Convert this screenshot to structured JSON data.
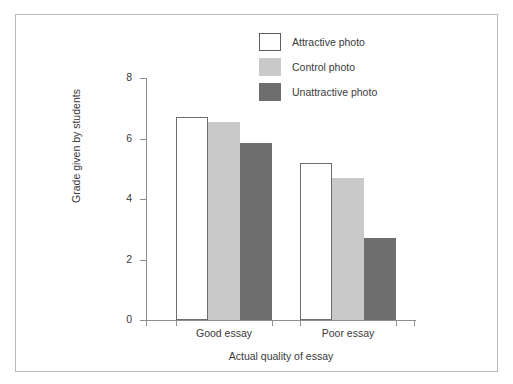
{
  "chart_data": {
    "type": "bar",
    "title": "",
    "xlabel": "Actual quality of essay",
    "ylabel": "Grade given by students",
    "categories": [
      "Good essay",
      "Poor essay"
    ],
    "series": [
      {
        "name": "Attractive photo",
        "values": [
          6.7,
          5.2
        ],
        "color": "#ffffff",
        "border": "#6e6e6e"
      },
      {
        "name": "Control photo",
        "values": [
          6.55,
          4.7
        ],
        "color": "#c9c9c9",
        "border": "#c9c9c9"
      },
      {
        "name": "Unattractive photo",
        "values": [
          5.85,
          2.7
        ],
        "color": "#6e6e6e",
        "border": "#6e6e6e"
      }
    ],
    "ylim": [
      0,
      8
    ],
    "yticks": [
      0,
      2,
      4,
      6,
      8
    ],
    "ytick_labels": [
      "0",
      "2",
      "4",
      "6",
      "8"
    ],
    "grid": false,
    "legend_position": "top-center"
  },
  "axes": {
    "y_title": "Grade given by students",
    "x_title": "Actual quality of essay",
    "y_labels": [
      "8",
      "6",
      "4",
      "2",
      "0"
    ],
    "x_labels": [
      "Good essay",
      "Poor essay"
    ]
  },
  "legend": {
    "items": [
      {
        "label": "Attractive photo"
      },
      {
        "label": "Control photo"
      },
      {
        "label": "Unattractive photo"
      }
    ]
  }
}
